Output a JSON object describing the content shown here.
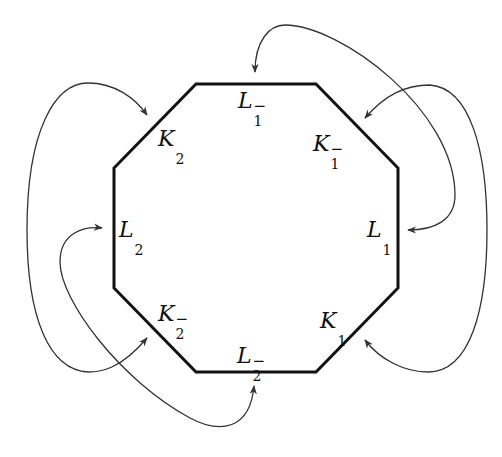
{
  "diagram": {
    "type": "octagon-edge-identification",
    "colors": {
      "edge": "#111111",
      "arrow": "#333333",
      "background": "#ffffff"
    },
    "octagon_vertices": [
      [
        196,
        84
      ],
      [
        316,
        84
      ],
      [
        398,
        168
      ],
      [
        398,
        288
      ],
      [
        316,
        372
      ],
      [
        196,
        372
      ],
      [
        114,
        288
      ],
      [
        114,
        168
      ]
    ],
    "labels": [
      {
        "id": "L1m",
        "base": "L",
        "sub": "1",
        "sup": "−",
        "position": "top"
      },
      {
        "id": "K1m",
        "base": "K",
        "sub": "1",
        "sup": "−",
        "position": "top-right"
      },
      {
        "id": "L1",
        "base": "L",
        "sub": "1",
        "sup": "",
        "position": "right"
      },
      {
        "id": "K1",
        "base": "K",
        "sub": "1",
        "sup": "",
        "position": "bottom-right"
      },
      {
        "id": "L2m",
        "base": "L",
        "sub": "2",
        "sup": "−",
        "position": "bottom"
      },
      {
        "id": "K2m",
        "base": "K",
        "sub": "2",
        "sup": "−",
        "position": "bottom-left"
      },
      {
        "id": "L2",
        "base": "L",
        "sub": "2",
        "sup": "",
        "position": "left"
      },
      {
        "id": "K2",
        "base": "K",
        "sub": "2",
        "sup": "",
        "position": "top-left"
      }
    ],
    "arrows": [
      {
        "from": "K2m",
        "to": "K2",
        "side": "left-outer"
      },
      {
        "from": "L2m",
        "to": "L2",
        "side": "left-inner"
      },
      {
        "from": "L1",
        "to": "L1m",
        "side": "right-top"
      },
      {
        "from": "K1",
        "to": "K1m",
        "side": "right-outer"
      }
    ]
  }
}
